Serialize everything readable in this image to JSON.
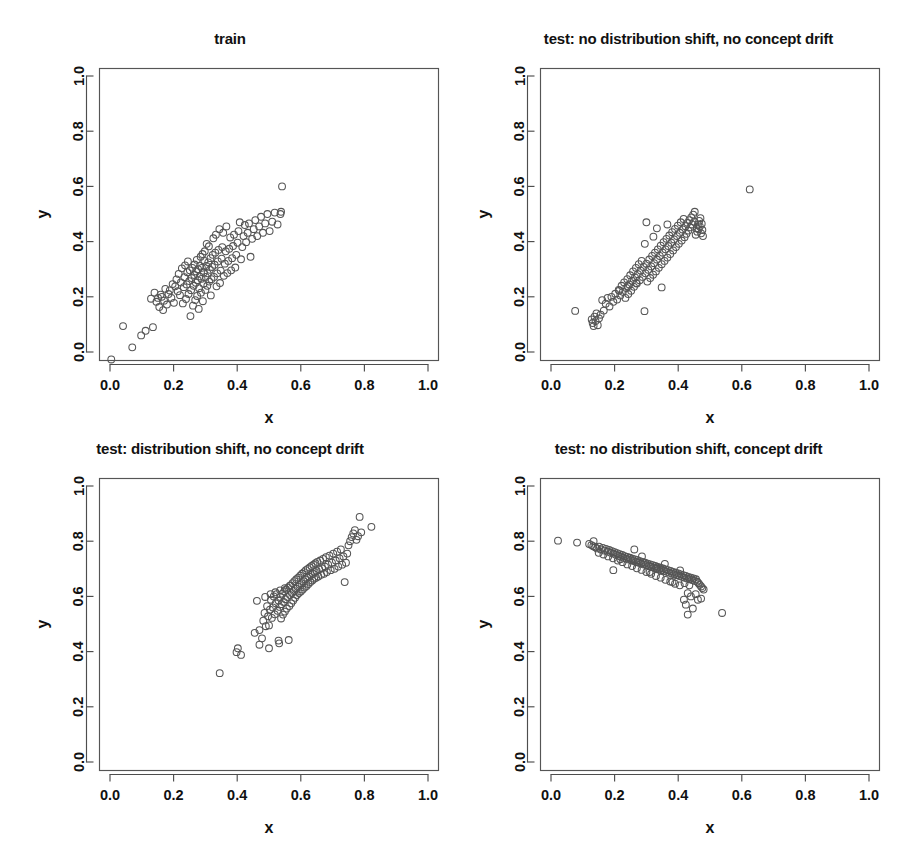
{
  "figure": {
    "width": 917,
    "height": 861,
    "background": "#ffffff",
    "point_color": "#555555",
    "axis_color": "#4d4d4d",
    "text_color": "#111111",
    "layout": "2x2 grid of scatter plots"
  },
  "chart_data": [
    {
      "type": "scatter",
      "panel": "top-left",
      "title": "train",
      "xlabel": "x",
      "ylabel": "y",
      "xlim": [
        0.0,
        1.0
      ],
      "ylim": [
        0.0,
        1.0
      ],
      "xticks": [
        "0.0",
        "0.2",
        "0.4",
        "0.6",
        "0.8",
        "1.0"
      ],
      "yticks": [
        "0.0",
        "0.2",
        "0.4",
        "0.6",
        "0.8",
        "1.0"
      ],
      "xtick_values": [
        0.0,
        0.2,
        0.4,
        0.6,
        0.8,
        1.0
      ],
      "ytick_values": [
        0.0,
        0.2,
        0.4,
        0.6,
        0.8,
        1.0
      ],
      "grid": false,
      "legend": null,
      "marker": "open-circle",
      "n_points": 140,
      "x": [
        0.004,
        0.041,
        0.07,
        0.098,
        0.112,
        0.129,
        0.135,
        0.14,
        0.146,
        0.151,
        0.155,
        0.159,
        0.163,
        0.167,
        0.17,
        0.174,
        0.179,
        0.184,
        0.188,
        0.193,
        0.197,
        0.201,
        0.205,
        0.209,
        0.213,
        0.216,
        0.22,
        0.223,
        0.226,
        0.229,
        0.232,
        0.234,
        0.236,
        0.239,
        0.241,
        0.243,
        0.245,
        0.247,
        0.249,
        0.251,
        0.253,
        0.255,
        0.257,
        0.259,
        0.261,
        0.263,
        0.265,
        0.266,
        0.268,
        0.27,
        0.271,
        0.273,
        0.274,
        0.276,
        0.277,
        0.279,
        0.28,
        0.282,
        0.283,
        0.285,
        0.286,
        0.288,
        0.289,
        0.291,
        0.292,
        0.294,
        0.295,
        0.297,
        0.298,
        0.3,
        0.301,
        0.303,
        0.304,
        0.306,
        0.307,
        0.309,
        0.311,
        0.312,
        0.314,
        0.316,
        0.317,
        0.319,
        0.321,
        0.323,
        0.325,
        0.327,
        0.329,
        0.331,
        0.333,
        0.335,
        0.337,
        0.339,
        0.341,
        0.344,
        0.346,
        0.348,
        0.351,
        0.353,
        0.356,
        0.358,
        0.361,
        0.364,
        0.366,
        0.369,
        0.372,
        0.375,
        0.378,
        0.381,
        0.384,
        0.387,
        0.39,
        0.394,
        0.397,
        0.401,
        0.404,
        0.408,
        0.412,
        0.416,
        0.42,
        0.424,
        0.428,
        0.433,
        0.437,
        0.442,
        0.447,
        0.452,
        0.457,
        0.463,
        0.469,
        0.475,
        0.481,
        0.488,
        0.495,
        0.502,
        0.51,
        0.518,
        0.527,
        0.536,
        0.541,
        0.538
      ],
      "y": [
        -0.027,
        0.094,
        0.017,
        0.06,
        0.077,
        0.193,
        0.09,
        0.215,
        0.182,
        0.196,
        0.163,
        0.208,
        0.2,
        0.152,
        0.186,
        0.229,
        0.172,
        0.21,
        0.223,
        0.196,
        0.246,
        0.178,
        0.238,
        0.263,
        0.22,
        0.283,
        0.206,
        0.252,
        0.303,
        0.176,
        0.235,
        0.271,
        0.314,
        0.192,
        0.245,
        0.289,
        0.328,
        0.21,
        0.257,
        0.296,
        0.13,
        0.224,
        0.268,
        0.305,
        0.168,
        0.24,
        0.279,
        0.317,
        0.188,
        0.251,
        0.292,
        0.334,
        0.203,
        0.26,
        0.3,
        0.156,
        0.231,
        0.274,
        0.312,
        0.345,
        0.215,
        0.265,
        0.305,
        0.355,
        0.184,
        0.247,
        0.288,
        0.33,
        0.365,
        0.225,
        0.272,
        0.312,
        0.392,
        0.24,
        0.285,
        0.325,
        0.383,
        0.255,
        0.298,
        0.34,
        0.205,
        0.264,
        0.308,
        0.352,
        0.412,
        0.272,
        0.316,
        0.36,
        0.425,
        0.238,
        0.285,
        0.328,
        0.37,
        0.445,
        0.25,
        0.295,
        0.338,
        0.38,
        0.432,
        0.276,
        0.32,
        0.365,
        0.455,
        0.286,
        0.33,
        0.374,
        0.415,
        0.296,
        0.34,
        0.384,
        0.425,
        0.306,
        0.352,
        0.396,
        0.438,
        0.47,
        0.336,
        0.38,
        0.42,
        0.46,
        0.398,
        0.432,
        0.466,
        0.345,
        0.41,
        0.445,
        0.478,
        0.42,
        0.455,
        0.49,
        0.432,
        0.466,
        0.5,
        0.438,
        0.472,
        0.505,
        0.462,
        0.5,
        0.6,
        0.508
      ]
    },
    {
      "type": "scatter",
      "panel": "top-right",
      "title": "test: no distribution shift, no concept drift",
      "xlabel": "x",
      "ylabel": "y",
      "xlim": [
        0.0,
        1.0
      ],
      "ylim": [
        0.0,
        1.0
      ],
      "xticks": [
        "0.0",
        "0.2",
        "0.4",
        "0.6",
        "0.8",
        "1.0"
      ],
      "yticks": [
        "0.0",
        "0.2",
        "0.4",
        "0.6",
        "0.8",
        "1.0"
      ],
      "xtick_values": [
        0.0,
        0.2,
        0.4,
        0.6,
        0.8,
        1.0
      ],
      "ytick_values": [
        0.0,
        0.2,
        0.4,
        0.6,
        0.8,
        1.0
      ],
      "grid": false,
      "legend": null,
      "marker": "open-circle",
      "n_points": 120,
      "x": [
        0.076,
        0.128,
        0.131,
        0.134,
        0.137,
        0.14,
        0.143,
        0.147,
        0.151,
        0.156,
        0.161,
        0.166,
        0.172,
        0.178,
        0.184,
        0.19,
        0.196,
        0.202,
        0.208,
        0.213,
        0.218,
        0.222,
        0.226,
        0.23,
        0.234,
        0.237,
        0.24,
        0.243,
        0.246,
        0.249,
        0.252,
        0.255,
        0.258,
        0.261,
        0.264,
        0.267,
        0.27,
        0.273,
        0.276,
        0.279,
        0.282,
        0.285,
        0.288,
        0.291,
        0.294,
        0.297,
        0.3,
        0.303,
        0.306,
        0.309,
        0.312,
        0.315,
        0.318,
        0.321,
        0.324,
        0.327,
        0.33,
        0.333,
        0.336,
        0.339,
        0.342,
        0.345,
        0.348,
        0.351,
        0.354,
        0.357,
        0.36,
        0.363,
        0.366,
        0.369,
        0.372,
        0.375,
        0.378,
        0.381,
        0.384,
        0.387,
        0.39,
        0.393,
        0.396,
        0.399,
        0.402,
        0.405,
        0.408,
        0.411,
        0.414,
        0.417,
        0.42,
        0.423,
        0.426,
        0.429,
        0.432,
        0.435,
        0.438,
        0.441,
        0.444,
        0.447,
        0.45,
        0.452,
        0.455,
        0.458,
        0.46,
        0.462,
        0.464,
        0.466,
        0.468,
        0.47,
        0.472,
        0.474,
        0.476,
        0.478,
        0.215,
        0.242,
        0.268,
        0.295,
        0.322,
        0.348,
        0.366,
        0.3,
        0.333,
        0.625
      ],
      "y": [
        0.149,
        0.118,
        0.105,
        0.094,
        0.128,
        0.112,
        0.14,
        0.097,
        0.122,
        0.135,
        0.188,
        0.15,
        0.175,
        0.196,
        0.165,
        0.2,
        0.182,
        0.211,
        0.19,
        0.225,
        0.205,
        0.24,
        0.218,
        0.252,
        0.196,
        0.232,
        0.264,
        0.21,
        0.245,
        0.278,
        0.222,
        0.258,
        0.292,
        0.236,
        0.27,
        0.305,
        0.248,
        0.282,
        0.318,
        0.26,
        0.295,
        0.33,
        0.272,
        0.308,
        0.148,
        0.285,
        0.32,
        0.255,
        0.298,
        0.335,
        0.268,
        0.31,
        0.348,
        0.28,
        0.322,
        0.36,
        0.292,
        0.335,
        0.372,
        0.305,
        0.348,
        0.385,
        0.318,
        0.36,
        0.398,
        0.33,
        0.372,
        0.41,
        0.342,
        0.384,
        0.422,
        0.355,
        0.396,
        0.434,
        0.368,
        0.408,
        0.446,
        0.38,
        0.42,
        0.458,
        0.392,
        0.432,
        0.47,
        0.404,
        0.444,
        0.482,
        0.416,
        0.456,
        0.428,
        0.468,
        0.44,
        0.478,
        0.452,
        0.488,
        0.462,
        0.498,
        0.472,
        0.508,
        0.425,
        0.448,
        0.436,
        0.462,
        0.445,
        0.475,
        0.455,
        0.485,
        0.43,
        0.465,
        0.442,
        0.42,
        0.222,
        0.238,
        0.25,
        0.392,
        0.418,
        0.234,
        0.462,
        0.47,
        0.448,
        0.589
      ]
    },
    {
      "type": "scatter",
      "panel": "bottom-left",
      "title": "test: distribution shift, no concept drift",
      "xlabel": "x",
      "ylabel": "y",
      "xlim": [
        0.0,
        1.0
      ],
      "ylim": [
        0.0,
        1.0
      ],
      "xticks": [
        "0.0",
        "0.2",
        "0.4",
        "0.6",
        "0.8",
        "1.0"
      ],
      "yticks": [
        "0.0",
        "0.2",
        "0.4",
        "0.6",
        "0.8",
        "1.0"
      ],
      "xtick_values": [
        0.0,
        0.2,
        0.4,
        0.6,
        0.8,
        1.0
      ],
      "ytick_values": [
        0.0,
        0.2,
        0.4,
        0.6,
        0.8,
        1.0
      ],
      "grid": false,
      "legend": null,
      "marker": "open-circle",
      "n_points": 130,
      "x": [
        0.345,
        0.398,
        0.402,
        0.412,
        0.455,
        0.462,
        0.47,
        0.478,
        0.482,
        0.486,
        0.49,
        0.494,
        0.497,
        0.5,
        0.503,
        0.506,
        0.509,
        0.512,
        0.515,
        0.518,
        0.521,
        0.524,
        0.527,
        0.53,
        0.532,
        0.534,
        0.536,
        0.538,
        0.54,
        0.542,
        0.544,
        0.546,
        0.548,
        0.55,
        0.552,
        0.554,
        0.556,
        0.558,
        0.56,
        0.562,
        0.564,
        0.566,
        0.568,
        0.57,
        0.572,
        0.574,
        0.576,
        0.578,
        0.58,
        0.582,
        0.584,
        0.586,
        0.588,
        0.59,
        0.592,
        0.594,
        0.596,
        0.598,
        0.6,
        0.602,
        0.604,
        0.606,
        0.608,
        0.61,
        0.612,
        0.614,
        0.616,
        0.618,
        0.62,
        0.622,
        0.624,
        0.626,
        0.628,
        0.63,
        0.632,
        0.634,
        0.636,
        0.638,
        0.64,
        0.642,
        0.644,
        0.646,
        0.648,
        0.65,
        0.652,
        0.655,
        0.658,
        0.661,
        0.664,
        0.667,
        0.67,
        0.673,
        0.676,
        0.679,
        0.682,
        0.686,
        0.69,
        0.694,
        0.698,
        0.702,
        0.706,
        0.71,
        0.714,
        0.718,
        0.722,
        0.726,
        0.73,
        0.734,
        0.738,
        0.742,
        0.746,
        0.75,
        0.755,
        0.76,
        0.765,
        0.77,
        0.775,
        0.78,
        0.785,
        0.79,
        0.822,
        0.488,
        0.505,
        0.52,
        0.535,
        0.55,
        0.565,
        0.47,
        0.5,
        0.53
      ],
      "y": [
        0.322,
        0.398,
        0.412,
        0.388,
        0.468,
        0.584,
        0.478,
        0.448,
        0.512,
        0.54,
        0.492,
        0.565,
        0.528,
        0.495,
        0.552,
        0.588,
        0.522,
        0.56,
        0.6,
        0.535,
        0.575,
        0.608,
        0.548,
        0.585,
        0.43,
        0.562,
        0.598,
        0.52,
        0.572,
        0.61,
        0.534,
        0.58,
        0.618,
        0.545,
        0.59,
        0.625,
        0.556,
        0.598,
        0.632,
        0.442,
        0.565,
        0.605,
        0.64,
        0.575,
        0.612,
        0.648,
        0.585,
        0.62,
        0.655,
        0.595,
        0.628,
        0.662,
        0.605,
        0.635,
        0.668,
        0.612,
        0.642,
        0.675,
        0.618,
        0.648,
        0.682,
        0.625,
        0.655,
        0.688,
        0.632,
        0.662,
        0.695,
        0.638,
        0.668,
        0.7,
        0.645,
        0.672,
        0.705,
        0.652,
        0.678,
        0.71,
        0.658,
        0.682,
        0.715,
        0.664,
        0.688,
        0.72,
        0.668,
        0.692,
        0.725,
        0.672,
        0.698,
        0.73,
        0.678,
        0.702,
        0.736,
        0.682,
        0.708,
        0.742,
        0.688,
        0.715,
        0.748,
        0.695,
        0.722,
        0.755,
        0.7,
        0.73,
        0.762,
        0.708,
        0.738,
        0.77,
        0.715,
        0.745,
        0.652,
        0.722,
        0.755,
        0.785,
        0.8,
        0.815,
        0.828,
        0.84,
        0.805,
        0.818,
        0.888,
        0.832,
        0.852,
        0.598,
        0.608,
        0.615,
        0.622,
        0.63,
        0.638,
        0.425,
        0.412,
        0.44
      ]
    },
    {
      "type": "scatter",
      "panel": "bottom-right",
      "title": "test: no distribution shift, concept drift",
      "xlabel": "x",
      "ylabel": "y",
      "xlim": [
        0.0,
        1.0
      ],
      "ylim": [
        0.0,
        1.0
      ],
      "xticks": [
        "0.0",
        "0.2",
        "0.4",
        "0.6",
        "0.8",
        "1.0"
      ],
      "yticks": [
        "0.0",
        "0.2",
        "0.4",
        "0.6",
        "0.8",
        "1.0"
      ],
      "xtick_values": [
        0.0,
        0.2,
        0.4,
        0.6,
        0.8,
        1.0
      ],
      "ytick_values": [
        0.0,
        0.2,
        0.4,
        0.6,
        0.8,
        1.0
      ],
      "grid": false,
      "legend": null,
      "marker": "open-circle",
      "n_points": 128,
      "x": [
        0.022,
        0.082,
        0.12,
        0.127,
        0.133,
        0.139,
        0.145,
        0.151,
        0.157,
        0.163,
        0.168,
        0.173,
        0.178,
        0.183,
        0.188,
        0.192,
        0.196,
        0.2,
        0.204,
        0.208,
        0.212,
        0.216,
        0.22,
        0.224,
        0.228,
        0.232,
        0.236,
        0.24,
        0.244,
        0.248,
        0.252,
        0.256,
        0.26,
        0.264,
        0.268,
        0.272,
        0.276,
        0.28,
        0.284,
        0.288,
        0.292,
        0.296,
        0.3,
        0.304,
        0.308,
        0.312,
        0.316,
        0.32,
        0.324,
        0.328,
        0.332,
        0.336,
        0.34,
        0.344,
        0.348,
        0.352,
        0.356,
        0.36,
        0.364,
        0.368,
        0.372,
        0.376,
        0.38,
        0.384,
        0.388,
        0.392,
        0.396,
        0.4,
        0.404,
        0.408,
        0.412,
        0.416,
        0.42,
        0.424,
        0.428,
        0.432,
        0.436,
        0.44,
        0.444,
        0.448,
        0.452,
        0.456,
        0.46,
        0.464,
        0.468,
        0.472,
        0.476,
        0.48,
        0.15,
        0.165,
        0.18,
        0.195,
        0.21,
        0.225,
        0.24,
        0.255,
        0.27,
        0.285,
        0.3,
        0.315,
        0.33,
        0.345,
        0.36,
        0.375,
        0.39,
        0.405,
        0.42,
        0.435,
        0.196,
        0.218,
        0.262,
        0.286,
        0.31,
        0.334,
        0.358,
        0.382,
        0.406,
        0.43,
        0.418,
        0.424,
        0.44,
        0.455,
        0.462,
        0.472,
        0.43,
        0.446,
        0.538,
        0.134
      ],
      "y": [
        0.802,
        0.795,
        0.79,
        0.786,
        0.782,
        0.778,
        0.774,
        0.78,
        0.77,
        0.776,
        0.766,
        0.772,
        0.762,
        0.768,
        0.758,
        0.764,
        0.755,
        0.76,
        0.751,
        0.757,
        0.747,
        0.753,
        0.744,
        0.75,
        0.74,
        0.746,
        0.737,
        0.743,
        0.734,
        0.74,
        0.731,
        0.737,
        0.728,
        0.734,
        0.725,
        0.731,
        0.722,
        0.728,
        0.719,
        0.725,
        0.716,
        0.722,
        0.713,
        0.719,
        0.71,
        0.716,
        0.707,
        0.713,
        0.704,
        0.71,
        0.701,
        0.707,
        0.698,
        0.704,
        0.695,
        0.701,
        0.692,
        0.698,
        0.689,
        0.695,
        0.686,
        0.692,
        0.683,
        0.689,
        0.68,
        0.686,
        0.677,
        0.683,
        0.674,
        0.68,
        0.671,
        0.677,
        0.668,
        0.674,
        0.665,
        0.671,
        0.662,
        0.668,
        0.659,
        0.665,
        0.656,
        0.662,
        0.653,
        0.648,
        0.642,
        0.636,
        0.63,
        0.625,
        0.758,
        0.752,
        0.745,
        0.738,
        0.73,
        0.724,
        0.716,
        0.71,
        0.702,
        0.696,
        0.688,
        0.682,
        0.674,
        0.668,
        0.66,
        0.654,
        0.646,
        0.64,
        0.648,
        0.64,
        0.695,
        0.735,
        0.77,
        0.745,
        0.688,
        0.702,
        0.718,
        0.652,
        0.694,
        0.612,
        0.588,
        0.57,
        0.6,
        0.608,
        0.588,
        0.592,
        0.534,
        0.556,
        0.54,
        0.8
      ]
    }
  ]
}
